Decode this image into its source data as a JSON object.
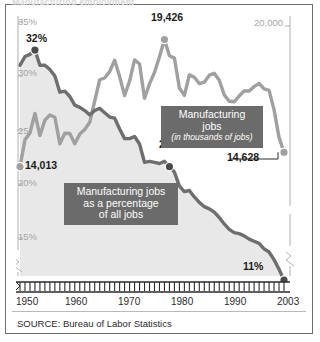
{
  "figure": {
    "clipped_title": "Manufacturing employment",
    "source": "SOURCE: Bureau of Labor Statistics"
  },
  "callouts": {
    "jobs": {
      "line1": "Manufacturing jobs",
      "line2": "(in thousands of jobs)"
    },
    "percent": {
      "line1": "Manufacturing jobs",
      "line2": "as a percentage",
      "line3": "of all jobs"
    }
  },
  "axis": {
    "left_ticks": [
      "35%",
      "30%",
      "25",
      "20%",
      "15%"
    ],
    "right_ticks": [
      "20,000"
    ],
    "x_ticks": [
      "1950",
      "1960",
      "1970",
      "1980",
      "1990",
      "2003"
    ]
  },
  "annotations": {
    "pct_start": "32%",
    "pct_1980": "22%",
    "pct_end": "11%",
    "jobs_start": "14,013",
    "jobs_peak": "19,426",
    "jobs_end": "14,628"
  },
  "colors": {
    "jobs_series": "#a0a0a0",
    "percent_series": "#6e6e6e",
    "percent_fill": "#e8e8e8",
    "callout_bg": "#6b6b6b",
    "axis": "#b0b0b0",
    "text": "#1b1b1b"
  },
  "chart_data": {
    "type": "line",
    "title": "Manufacturing employment",
    "xlabel": "",
    "ylabel": "",
    "grid": false,
    "legend_position": "inline-callouts",
    "xlim": [
      1950,
      2003
    ],
    "x": [
      1950,
      1951,
      1952,
      1953,
      1954,
      1955,
      1956,
      1957,
      1958,
      1959,
      1960,
      1961,
      1962,
      1963,
      1964,
      1965,
      1966,
      1967,
      1968,
      1969,
      1970,
      1971,
      1972,
      1973,
      1974,
      1975,
      1976,
      1977,
      1978,
      1979,
      1980,
      1981,
      1982,
      1983,
      1984,
      1985,
      1986,
      1987,
      1988,
      1989,
      1990,
      1991,
      1992,
      1993,
      1994,
      1995,
      1996,
      1997,
      1998,
      1999,
      2000,
      2001,
      2002,
      2003
    ],
    "series": [
      {
        "name": "Manufacturing jobs",
        "units": "thousands of jobs",
        "axis": "right",
        "color": "#a0a0a0",
        "ylim": [
          12000,
          20500
        ],
        "axis_break": true,
        "values": [
          14013,
          15155,
          15445,
          16282,
          15338,
          15995,
          16210,
          16119,
          14986,
          15438,
          15424,
          14987,
          15402,
          15593,
          15901,
          16809,
          17713,
          17787,
          18066,
          18543,
          17848,
          17043,
          17653,
          18559,
          18385,
          16923,
          17536,
          18021,
          18691,
          19426,
          18733,
          18634,
          17363,
          17048,
          17920,
          17819,
          17552,
          17609,
          17906,
          17985,
          17695,
          17068,
          16799,
          16774,
          17021,
          17241,
          17237,
          17419,
          17560,
          17322,
          17263,
          16441,
          15259,
          14628
        ]
      },
      {
        "name": "Manufacturing jobs as a percentage of all jobs",
        "units": "percent of all jobs",
        "axis": "left",
        "color": "#6e6e6e",
        "ylim": [
          10,
          36
        ],
        "axis_break": true,
        "values": [
          31.0,
          31.8,
          32.0,
          32.4,
          31.0,
          31.0,
          30.6,
          30.0,
          28.5,
          28.6,
          28.1,
          27.3,
          27.1,
          26.8,
          26.4,
          26.8,
          27.0,
          26.6,
          26.2,
          26.1,
          25.1,
          24.2,
          24.2,
          24.4,
          23.7,
          22.0,
          22.1,
          22.0,
          21.9,
          22.1,
          21.6,
          21.1,
          19.8,
          19.3,
          19.4,
          18.8,
          18.3,
          17.9,
          17.7,
          17.4,
          16.9,
          16.3,
          15.8,
          15.5,
          15.4,
          15.2,
          14.9,
          14.7,
          14.5,
          14.0,
          13.7,
          13.0,
          12.1,
          11.1
        ]
      }
    ],
    "annotated_points": [
      {
        "series": "Manufacturing jobs as a percentage of all jobs",
        "x": 1953,
        "y": 32.4,
        "label": "32%"
      },
      {
        "series": "Manufacturing jobs as a percentage of all jobs",
        "x": 1980,
        "y": 21.6,
        "label": "22%"
      },
      {
        "series": "Manufacturing jobs as a percentage of all jobs",
        "x": 2003,
        "y": 11.1,
        "label": "11%"
      },
      {
        "series": "Manufacturing jobs",
        "x": 1950,
        "y": 14013,
        "label": "14,013"
      },
      {
        "series": "Manufacturing jobs",
        "x": 1979,
        "y": 19426,
        "label": "19,426"
      },
      {
        "series": "Manufacturing jobs",
        "x": 2003,
        "y": 14628,
        "label": "14,628"
      }
    ]
  }
}
